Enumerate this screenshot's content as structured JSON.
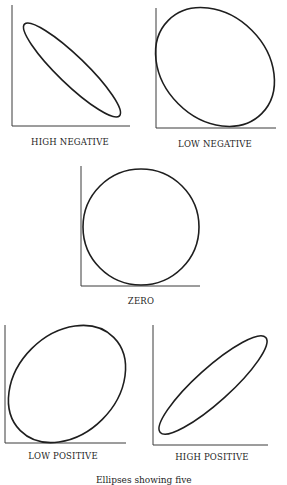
{
  "figure": {
    "panels": [
      {
        "id": "high-negative",
        "label": "HIGH NEGATIVE",
        "correlation": "high negative"
      },
      {
        "id": "low-negative",
        "label": "LOW NEGATIVE",
        "correlation": "low negative"
      },
      {
        "id": "zero",
        "label": "ZERO",
        "correlation": "zero"
      },
      {
        "id": "low-positive",
        "label": "LOW POSITIVE",
        "correlation": "low positive"
      },
      {
        "id": "high-positive",
        "label": "HIGH POSITIVE",
        "correlation": "high positive"
      }
    ],
    "caption": "Ellipses showing five",
    "colors": {
      "ink": "#1e1e1e",
      "background": "#ffffff"
    }
  }
}
